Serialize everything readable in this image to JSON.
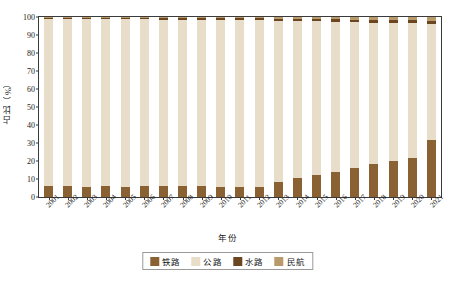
{
  "chart_data": {
    "type": "bar",
    "subtype": "stacked-percentage",
    "title": "",
    "xlabel": "年份",
    "ylabel": "占比（%）",
    "ylim": [
      0,
      100
    ],
    "yticks": [
      0,
      10,
      20,
      30,
      40,
      50,
      60,
      70,
      80,
      90,
      100
    ],
    "grid": false,
    "legend_position": "bottom",
    "categories": [
      "2001",
      "2002",
      "2003",
      "2004",
      "2005",
      "2006",
      "2007",
      "2008",
      "2009",
      "2010",
      "2011",
      "2012",
      "2013",
      "2014",
      "2015",
      "2016",
      "2017",
      "2018",
      "2019",
      "2020",
      "2021"
    ],
    "series": [
      {
        "name": "铁路",
        "color": "#8a6133",
        "values": [
          6.0,
          6.0,
          5.8,
          6.0,
          5.6,
          6.2,
          6.0,
          6.0,
          5.9,
          5.6,
          5.6,
          5.6,
          8.2,
          10.6,
          12.3,
          13.9,
          16.1,
          18.6,
          20.2,
          21.9,
          31.9
        ]
      },
      {
        "name": "公路",
        "color": "#e7ddc8",
        "values": [
          92.8,
          92.8,
          93.0,
          92.7,
          93.1,
          92.5,
          92.6,
          92.5,
          92.5,
          92.7,
          92.6,
          92.5,
          89.8,
          87.2,
          85.3,
          83.5,
          81.0,
          78.2,
          76.3,
          74.6,
          64.3
        ]
      },
      {
        "name": "水路",
        "color": "#6b4620",
        "values": [
          0.9,
          0.9,
          0.9,
          0.9,
          0.9,
          0.9,
          0.9,
          1.0,
          1.0,
          1.1,
          1.1,
          1.1,
          1.1,
          1.2,
          1.3,
          1.4,
          1.5,
          1.6,
          1.7,
          1.8,
          1.8
        ]
      },
      {
        "name": "民航",
        "color": "#b99a6b",
        "values": [
          0.3,
          0.3,
          0.3,
          0.4,
          0.4,
          0.4,
          0.5,
          0.5,
          0.6,
          0.6,
          0.7,
          0.8,
          0.9,
          1.0,
          1.1,
          1.2,
          1.4,
          1.6,
          1.8,
          1.7,
          2.0
        ]
      }
    ]
  },
  "axes": {
    "y_axis_title": "占比（%）",
    "x_axis_title": "年份"
  },
  "legend": {
    "items": [
      {
        "label": "铁路",
        "color": "#8a6133"
      },
      {
        "label": "公路",
        "color": "#e7ddc8"
      },
      {
        "label": "水路",
        "color": "#6b4620"
      },
      {
        "label": "民航",
        "color": "#b99a6b"
      }
    ]
  },
  "style": {
    "axis_color": "#3a3a3a",
    "text_color": "#1a1a1a",
    "background": "#ffffff"
  }
}
